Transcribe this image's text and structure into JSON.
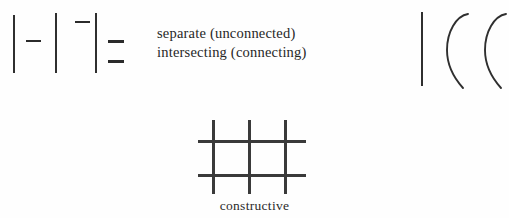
{
  "figure": {
    "background_color": "#fefefe",
    "ink_color": "#2b2b2b",
    "legend": {
      "lines": [
        {
          "label": "separate (unconnected)"
        },
        {
          "label": "intersecting (connecting)"
        }
      ]
    },
    "caption": "constructive",
    "left_cluster": {
      "name": "stroke-relation-glyphs",
      "vertical_bars": [
        {
          "x": 13,
          "y": 15,
          "w": 2,
          "h": 58
        },
        {
          "x": 55,
          "y": 13,
          "w": 2,
          "h": 60
        },
        {
          "x": 95,
          "y": 13,
          "w": 2,
          "h": 60
        }
      ],
      "dashes": [
        {
          "x": 26,
          "y": 40,
          "w": 15,
          "h": 2
        },
        {
          "x": 75,
          "y": 21,
          "w": 15,
          "h": 2
        },
        {
          "x": 108,
          "y": 40,
          "w": 16,
          "h": 3
        },
        {
          "x": 108,
          "y": 60,
          "w": 16,
          "h": 3
        }
      ]
    },
    "grid_figure": {
      "name": "constructive-grid",
      "vertical_lines": [
        {
          "x": 16,
          "y": 2,
          "w": 3,
          "h": 74
        },
        {
          "x": 52,
          "y": 2,
          "w": 3,
          "h": 74
        },
        {
          "x": 88,
          "y": 2,
          "w": 3,
          "h": 74
        }
      ],
      "horizontal_lines": [
        {
          "x": 2,
          "y": 22,
          "w": 108,
          "h": 3
        },
        {
          "x": 2,
          "y": 56,
          "w": 108,
          "h": 3
        }
      ]
    },
    "right_figure": {
      "name": "brush-stroke-samples",
      "vertical_stroke": {
        "x": 421,
        "y": 12,
        "w": 2,
        "h": 74
      },
      "curves": [
        {
          "name": "curve-stroke-1"
        },
        {
          "name": "curve-stroke-2"
        }
      ]
    }
  }
}
